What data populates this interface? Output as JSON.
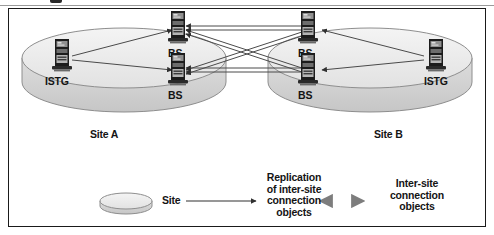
{
  "figure": {
    "type": "network-topology-diagram",
    "background_color": "#ffffff",
    "border_color": "#1a1a1a"
  },
  "sites": [
    {
      "id": "site-a",
      "label": "Site A",
      "fill_color": "#e8e8e8",
      "servers": [
        {
          "id": "istg-a",
          "label": "ISTG",
          "role": "istg"
        },
        {
          "id": "bs-a1",
          "label": "BS",
          "role": "bridgehead"
        },
        {
          "id": "bs-a2",
          "label": "BS",
          "role": "bridgehead"
        }
      ]
    },
    {
      "id": "site-b",
      "label": "Site B",
      "fill_color": "#e8e8e8",
      "servers": [
        {
          "id": "istg-b",
          "label": "ISTG",
          "role": "istg"
        },
        {
          "id": "bs-b1",
          "label": "BS",
          "role": "bridgehead"
        },
        {
          "id": "bs-b2",
          "label": "BS",
          "role": "bridgehead"
        }
      ]
    }
  ],
  "legend": {
    "items": [
      {
        "id": "site-key",
        "symbol": "ellipse",
        "label": "Site"
      },
      {
        "id": "replication-key",
        "symbol": "thin-arrow",
        "label": "Replication\nof inter-site\nconnection\nobjects",
        "lines": [
          "Replication",
          "of inter-site",
          "connection",
          "objects"
        ]
      },
      {
        "id": "connection-key",
        "symbol": "thick-double-arrow",
        "label": "Inter-site\nconnection\nobjects",
        "lines": [
          "Inter-site",
          "connection",
          "objects"
        ]
      }
    ]
  },
  "colors": {
    "site_fill_top": "#ededed",
    "site_fill_side": "#d2d2d2",
    "site_stroke": "#8a8a8a",
    "line": "#4a4a4a",
    "thick_arrow": "#8c8c8c",
    "server_body": "#1c1c1c",
    "text": "#141414"
  }
}
